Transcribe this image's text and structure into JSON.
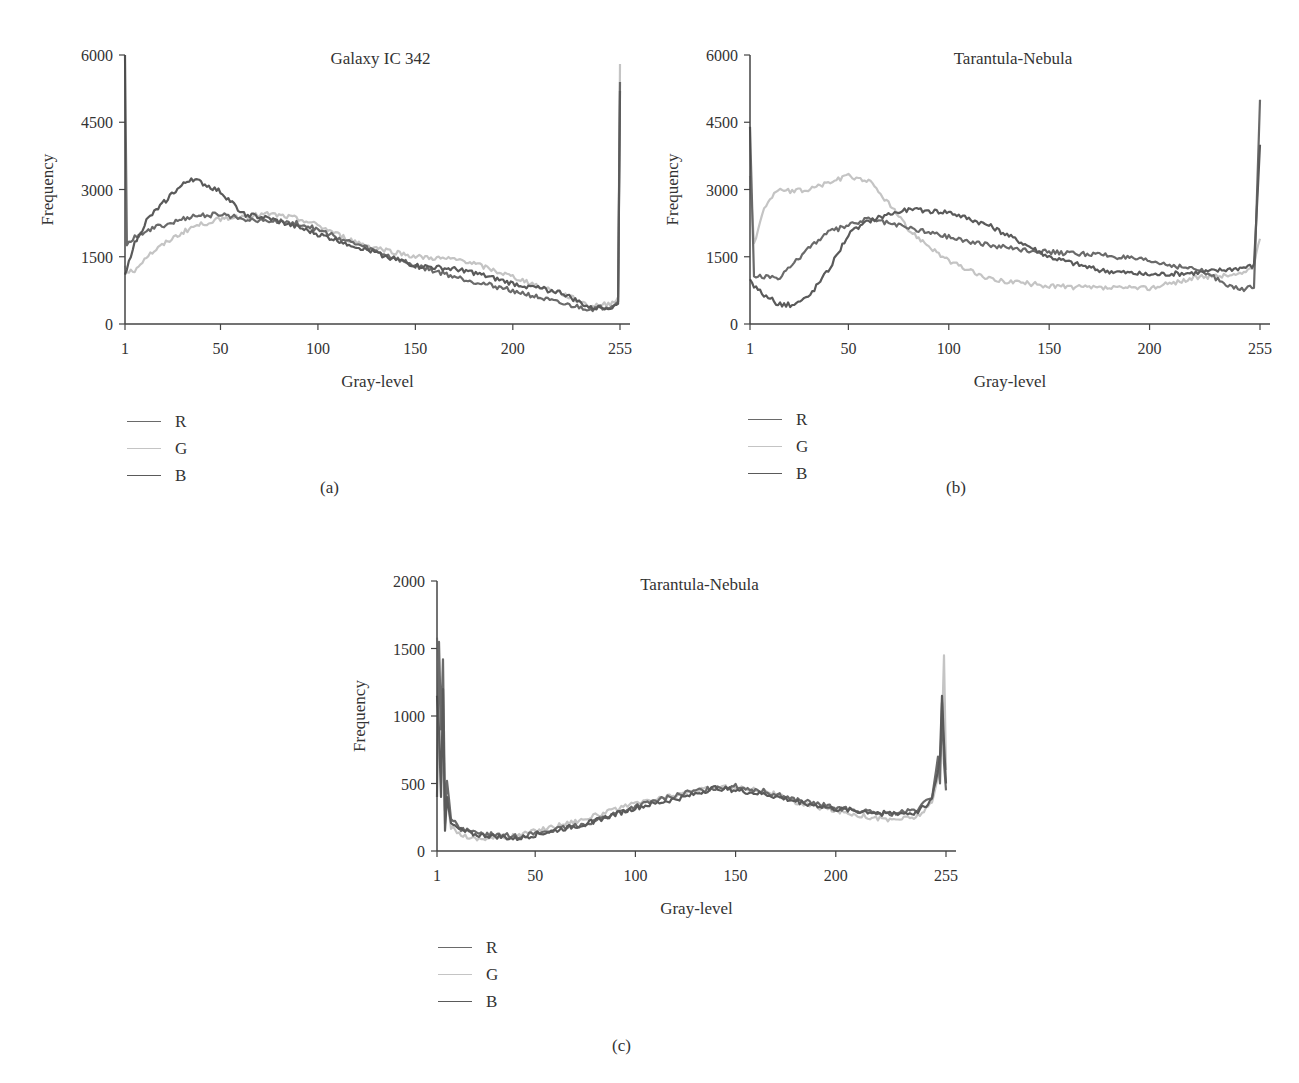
{
  "colors": {
    "R": "#6a6a6a",
    "G": "#c4c4c4",
    "B": "#5a5a5a",
    "axis": "#444444"
  },
  "panels": [
    {
      "id": "a",
      "label": "(a)",
      "legend": [
        "R",
        "G",
        "B"
      ]
    },
    {
      "id": "b",
      "label": "(b)",
      "legend": [
        "R",
        "G",
        "B"
      ]
    },
    {
      "id": "c",
      "label": "(c)",
      "legend": [
        "R",
        "G",
        "B"
      ]
    }
  ],
  "chart_data": [
    {
      "type": "line",
      "note": "Approximate values estimated visually from the rendered histogram, not exact data",
      "title": "Galaxy IC 342",
      "xlabel": "Gray-level",
      "ylabel": "Frequency",
      "xlim": [
        1,
        256
      ],
      "ylim": [
        0,
        6000
      ],
      "xticks": [
        1,
        50,
        100,
        150,
        200,
        255
      ],
      "yticks": [
        0,
        1500,
        3000,
        4500,
        6000
      ],
      "grid": false,
      "legend_position": "below-left",
      "x": [
        1,
        2,
        5,
        12,
        25,
        35,
        50,
        62,
        75,
        90,
        100,
        115,
        125,
        150,
        175,
        200,
        225,
        240,
        250,
        254,
        255
      ],
      "series": [
        {
          "name": "R",
          "values": [
            6000,
            1800,
            1900,
            2100,
            2250,
            2400,
            2450,
            2350,
            2300,
            2250,
            2100,
            1850,
            1700,
            1300,
            1000,
            750,
            450,
            330,
            400,
            500,
            5400
          ]
        },
        {
          "name": "G",
          "values": [
            1300,
            1200,
            1150,
            1500,
            1900,
            2150,
            2350,
            2400,
            2450,
            2350,
            2200,
            1900,
            1750,
            1500,
            1420,
            1050,
            680,
            400,
            450,
            600,
            5800
          ]
        },
        {
          "name": "B",
          "values": [
            1100,
            1200,
            1700,
            2300,
            2900,
            3250,
            2950,
            2450,
            2350,
            2150,
            2000,
            1800,
            1650,
            1300,
            1200,
            900,
            700,
            350,
            380,
            450,
            5200
          ]
        }
      ]
    },
    {
      "type": "line",
      "note": "Approximate values estimated visually from the rendered histogram, not exact data",
      "title": "Tarantula-Nebula",
      "xlabel": "Gray-level",
      "ylabel": "Frequency",
      "xlim": [
        1,
        256
      ],
      "ylim": [
        0,
        6000
      ],
      "xticks": [
        1,
        50,
        100,
        150,
        200,
        255
      ],
      "yticks": [
        0,
        1500,
        3000,
        4500,
        6000
      ],
      "grid": false,
      "legend_position": "below-left",
      "x": [
        1,
        3,
        8,
        15,
        22,
        30,
        40,
        50,
        60,
        70,
        80,
        100,
        120,
        150,
        175,
        200,
        225,
        245,
        252,
        255
      ],
      "series": [
        {
          "name": "R",
          "values": [
            4400,
            1050,
            1050,
            1000,
            1300,
            1700,
            2050,
            2200,
            2350,
            2250,
            2150,
            1950,
            1750,
            1600,
            1550,
            1400,
            1200,
            750,
            850,
            5000
          ]
        },
        {
          "name": "G",
          "values": [
            3300,
            1800,
            2600,
            3000,
            2950,
            3000,
            3150,
            3300,
            3200,
            2700,
            2100,
            1400,
            1000,
            850,
            800,
            800,
            1050,
            1100,
            1300,
            1900
          ]
        },
        {
          "name": "B",
          "values": [
            1000,
            850,
            650,
            450,
            420,
            600,
            1200,
            2000,
            2300,
            2450,
            2550,
            2500,
            2200,
            1500,
            1200,
            1100,
            1150,
            1250,
            1300,
            4000
          ]
        }
      ]
    },
    {
      "type": "line",
      "note": "Approximate values estimated visually from the rendered histogram, not exact data",
      "title": "Tarantula-Nebula",
      "xlabel": "Gray-level",
      "ylabel": "Frequency",
      "xlim": [
        1,
        256
      ],
      "ylim": [
        0,
        2000
      ],
      "xticks": [
        1,
        50,
        100,
        150,
        200,
        255
      ],
      "yticks": [
        0,
        500,
        1000,
        1500,
        2000
      ],
      "grid": false,
      "legend_position": "below-left",
      "x": [
        1,
        2,
        3,
        4,
        5,
        6,
        8,
        12,
        20,
        30,
        40,
        50,
        75,
        100,
        125,
        140,
        150,
        165,
        180,
        200,
        225,
        240,
        248,
        251,
        252,
        253,
        254,
        255
      ],
      "series": [
        {
          "name": "R",
          "values": [
            400,
            1550,
            900,
            1420,
            300,
            520,
            250,
            170,
            130,
            120,
            110,
            130,
            200,
            330,
            430,
            470,
            480,
            440,
            380,
            320,
            270,
            300,
            400,
            700,
            500,
            1100,
            650,
            450
          ]
        },
        {
          "name": "G",
          "values": [
            1580,
            1400,
            500,
            800,
            200,
            400,
            180,
            130,
            90,
            100,
            110,
            150,
            240,
            350,
            430,
            470,
            470,
            450,
            360,
            300,
            230,
            250,
            350,
            550,
            650,
            900,
            1450,
            600
          ]
        },
        {
          "name": "B",
          "values": [
            1150,
            900,
            400,
            1200,
            150,
            400,
            200,
            160,
            120,
            110,
            90,
            120,
            200,
            320,
            400,
            470,
            450,
            420,
            370,
            310,
            280,
            280,
            380,
            600,
            700,
            1150,
            800,
            500
          ]
        }
      ]
    }
  ]
}
